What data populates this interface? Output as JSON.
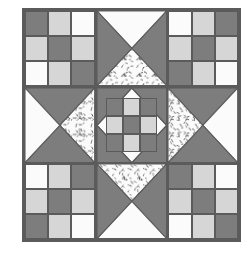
{
  "diagram": {
    "kind": "pieced quilt block diagram",
    "block_name": "Star with Nine-Patch Corners",
    "grid": "3x3 units",
    "background_color": "#ffffff",
    "line_color": "#5b5b5b"
  },
  "fabrics": {
    "dark": {
      "name": "dark gray solid",
      "color": "#7d7d7d"
    },
    "medium": {
      "name": "light gray solid",
      "color": "#d6d6d6"
    },
    "light": {
      "name": "white solid",
      "color": "#fbfbfb"
    },
    "speckled": {
      "name": "white speckled print",
      "color": "#fbfbfb",
      "fleck_color": "#3b3b3b"
    }
  },
  "units": {
    "top_left": {
      "label": "top-left nine-patch",
      "type": "nine-patch",
      "patches": [
        "dark",
        "medium",
        "light",
        "medium",
        "dark",
        "medium",
        "light",
        "medium",
        "dark"
      ]
    },
    "top_center": {
      "label": "top quarter-square triangle",
      "type": "quarter-square-triangle",
      "triangles": {
        "top": "light",
        "right": "dark",
        "bottom": "speckled",
        "left": "dark"
      }
    },
    "top_right": {
      "label": "top-right nine-patch",
      "type": "nine-patch",
      "patches": [
        "light",
        "medium",
        "dark",
        "medium",
        "dark",
        "medium",
        "dark",
        "medium",
        "light"
      ]
    },
    "middle_left": {
      "label": "left quarter-square triangle",
      "type": "quarter-square-triangle",
      "triangles": {
        "top": "dark",
        "right": "speckled",
        "bottom": "dark",
        "left": "light"
      }
    },
    "center": {
      "label": "center nine-patch on point",
      "type": "nine-patch-on-point",
      "corner_triangles": "dark",
      "patches": [
        "dark",
        "medium",
        "dark",
        "medium",
        "dark",
        "medium",
        "dark",
        "medium",
        "dark"
      ]
    },
    "middle_right": {
      "label": "right quarter-square triangle",
      "type": "quarter-square-triangle",
      "triangles": {
        "top": "dark",
        "right": "light",
        "bottom": "dark",
        "left": "speckled"
      }
    },
    "bottom_left": {
      "label": "bottom-left nine-patch",
      "type": "nine-patch",
      "patches": [
        "light",
        "medium",
        "dark",
        "medium",
        "dark",
        "medium",
        "dark",
        "medium",
        "light"
      ]
    },
    "bottom_center": {
      "label": "bottom quarter-square triangle",
      "type": "quarter-square-triangle",
      "triangles": {
        "top": "speckled",
        "right": "dark",
        "bottom": "light",
        "left": "dark"
      }
    },
    "bottom_right": {
      "label": "bottom-right nine-patch",
      "type": "nine-patch",
      "patches": [
        "dark",
        "medium",
        "light",
        "medium",
        "dark",
        "medium",
        "light",
        "medium",
        "dark"
      ]
    }
  }
}
